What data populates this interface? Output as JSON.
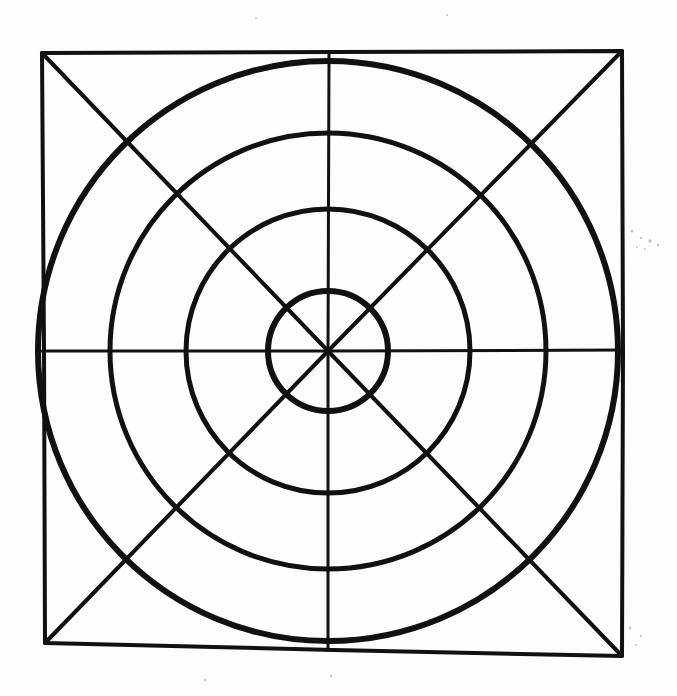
{
  "document": {
    "title": "Concentric Circles in a Square",
    "media": "hand-drawn ink on paper (scanned)",
    "background_color": "#fdfdfd",
    "ink_color": "#111111",
    "canvas": {
      "width": 677,
      "height": 696
    }
  },
  "figure": {
    "name": "concentric-circles-in-square",
    "center": {
      "x": 328,
      "y": 351
    },
    "square": {
      "name": "bounding-square",
      "corners": {
        "top_left": {
          "x": 42,
          "y": 53
        },
        "top_right": {
          "x": 622,
          "y": 51
        },
        "bottom_right": {
          "x": 622,
          "y": 656
        },
        "bottom_left": {
          "x": 45,
          "y": 643
        }
      },
      "stroke_width": 4
    },
    "circles": [
      {
        "name": "circle-outer",
        "index": 1,
        "radius": 290,
        "stroke_width": 6
      },
      {
        "name": "circle-third",
        "index": 2,
        "radius": 218,
        "stroke_width": 5
      },
      {
        "name": "circle-second",
        "index": 3,
        "radius": 142,
        "stroke_width": 5
      },
      {
        "name": "circle-inner",
        "index": 4,
        "radius": 60,
        "stroke_width": 6
      }
    ],
    "axes": [
      {
        "name": "horizontal-median",
        "orientation": "horizontal",
        "from": {
          "x": 42,
          "y": 351
        },
        "to": {
          "x": 622,
          "y": 350
        },
        "stroke_width": 3
      },
      {
        "name": "vertical-median",
        "orientation": "vertical",
        "from": {
          "x": 329,
          "y": 53
        },
        "to": {
          "x": 328,
          "y": 650
        },
        "stroke_width": 3
      }
    ],
    "diagonals": [
      {
        "name": "diagonal-tl-br",
        "from": {
          "x": 42,
          "y": 53
        },
        "to": {
          "x": 622,
          "y": 656
        },
        "stroke_width": 4
      },
      {
        "name": "diagonal-tr-bl",
        "from": {
          "x": 622,
          "y": 51
        },
        "to": {
          "x": 45,
          "y": 643
        },
        "stroke_width": 4
      }
    ],
    "axis_crossings": {
      "description": "radii where circles cross the medians, measured from center",
      "horizontal_left": [
        268,
        185,
        117,
        42
      ],
      "horizontal_right": [
        388,
        470,
        545,
        622
      ],
      "vertical_up": [
        290,
        208,
        132,
        54
      ],
      "vertical_down": [
        410,
        492,
        570,
        643
      ]
    },
    "specks": [
      {
        "x": 632,
        "y": 231,
        "r": 1.6
      },
      {
        "x": 641,
        "y": 238,
        "r": 1.2
      },
      {
        "x": 650,
        "y": 241,
        "r": 1.8
      },
      {
        "x": 645,
        "y": 249,
        "r": 1.1
      },
      {
        "x": 658,
        "y": 245,
        "r": 1.3
      },
      {
        "x": 637,
        "y": 247,
        "r": 1.0
      },
      {
        "x": 630,
        "y": 628,
        "r": 1.4
      },
      {
        "x": 641,
        "y": 636,
        "r": 1.2
      },
      {
        "x": 636,
        "y": 645,
        "r": 1.0
      },
      {
        "x": 205,
        "y": 680,
        "r": 1.2
      },
      {
        "x": 331,
        "y": 676,
        "r": 1.3
      },
      {
        "x": 256,
        "y": 18,
        "r": 1.1
      },
      {
        "x": 447,
        "y": 15,
        "r": 1.0
      }
    ]
  }
}
